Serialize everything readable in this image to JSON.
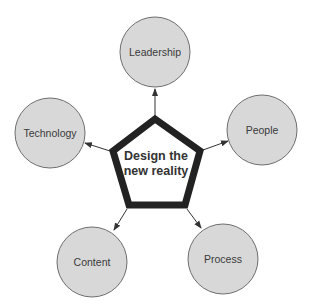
{
  "diagram": {
    "center": {
      "label_line1": "Design the",
      "label_line2": "new reality"
    },
    "nodes": [
      {
        "id": "leadership",
        "label": "Leadership"
      },
      {
        "id": "people",
        "label": "People"
      },
      {
        "id": "process",
        "label": "Process"
      },
      {
        "id": "content",
        "label": "Content"
      },
      {
        "id": "technology",
        "label": "Technology"
      }
    ],
    "colors": {
      "node_fill": "#d8d8d8",
      "node_stroke": "#6e6e6e",
      "pentagon_stroke": "#222222",
      "arrow": "#333333"
    }
  }
}
